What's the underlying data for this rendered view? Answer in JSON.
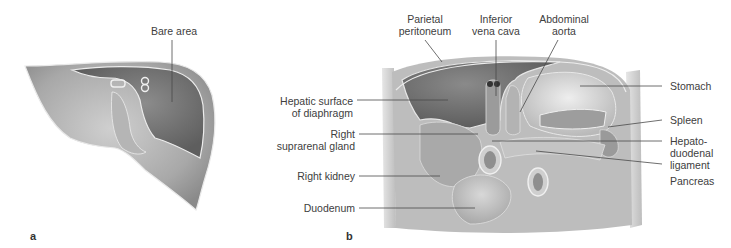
{
  "figure": {
    "panels": [
      {
        "id": "a",
        "letter": "a",
        "subject": "Liver, posterior view",
        "labels": [
          {
            "key": "bare_area",
            "text": "Bare area"
          }
        ]
      },
      {
        "id": "b",
        "letter": "b",
        "subject": "Posterior abdominal wall with peritoneal relations",
        "labels": [
          {
            "key": "parietal_peritoneum",
            "line1": "Parietal",
            "line2": "peritoneum"
          },
          {
            "key": "inferior_vena_cava",
            "line1": "Inferior",
            "line2": "vena cava"
          },
          {
            "key": "abdominal_aorta",
            "line1": "Abdominal",
            "line2": "aorta"
          },
          {
            "key": "hepatic_surface",
            "line1": "Hepatic surface",
            "line2": "of diaphragm"
          },
          {
            "key": "right_suprarenal",
            "line1": "Right",
            "line2": "suprarenal gland"
          },
          {
            "key": "right_kidney",
            "text": "Right kidney"
          },
          {
            "key": "duodenum",
            "text": "Duodenum"
          },
          {
            "key": "stomach",
            "text": "Stomach"
          },
          {
            "key": "spleen",
            "text": "Spleen"
          },
          {
            "key": "hepatoduodenal",
            "line1": "Hepato-",
            "line2": "duodenal",
            "line3": "ligament"
          },
          {
            "key": "pancreas",
            "text": "Pancreas"
          }
        ]
      }
    ]
  },
  "colors": {
    "background": "#ffffff",
    "organ_light": "#c9c9c9",
    "organ_mid": "#9e9e9e",
    "organ_dark": "#6f6f6f",
    "outline": "#e8e8e8",
    "label_text": "#404040",
    "leader_line": "#4a4a4a"
  }
}
